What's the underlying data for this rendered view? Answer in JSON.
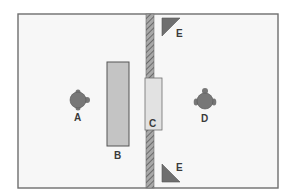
{
  "diagram": {
    "type": "floor-plan",
    "colors": {
      "background": "#ffffff",
      "room_fill": "#f7f7f7",
      "room_border": "#6e6e6e",
      "wall_fill": "#9a9a9a",
      "wall_hatch": "#555555",
      "panel_b_fill": "#c4c4c4",
      "panel_c_fill": "#e2e2e2",
      "person_fill": "#777777",
      "triangle_fill": "#6f6f6f",
      "label": "#3a3a3a"
    },
    "elements": {
      "person_a": {
        "label": "A",
        "role": "person-facing-right"
      },
      "panel_b": {
        "label": "B",
        "role": "tall-panel-left"
      },
      "panel_c": {
        "label": "C",
        "role": "window-in-wall"
      },
      "person_d": {
        "label": "D",
        "role": "person-facing-left"
      },
      "triangle_e_top": {
        "label": "E",
        "role": "corner-marker-top"
      },
      "triangle_e_bottom": {
        "label": "E",
        "role": "corner-marker-bottom"
      }
    }
  }
}
